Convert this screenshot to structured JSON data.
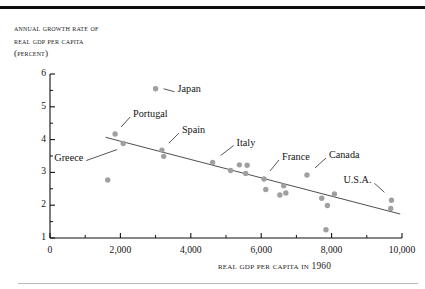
{
  "figure": {
    "y_axis_title_lines": [
      "Annual growth rate of",
      "real GDP per capita",
      "(percent)"
    ],
    "x_axis_title": "Real GDP per capita in 1960"
  },
  "chart_data": {
    "type": "scatter",
    "title": "",
    "xlabel": "Real GDP per capita in 1960",
    "ylabel": "Annual growth rate of real GDP per capita (percent)",
    "xlim": [
      0,
      10000
    ],
    "ylim": [
      1,
      6
    ],
    "grid": false,
    "legend": false,
    "xticks": [
      0,
      2000,
      4000,
      6000,
      8000,
      10000
    ],
    "xtick_labels": [
      "0",
      "2,000",
      "4,000",
      "6,000",
      "8,000",
      "10,000"
    ],
    "xminor_ticks": [
      1000,
      3000,
      5000,
      7000,
      9000
    ],
    "yticks": [
      1,
      2,
      3,
      4,
      5,
      6
    ],
    "ytick_labels": [
      "1",
      "2",
      "3",
      "4",
      "5",
      "6"
    ],
    "yminor_ticks": [
      1.5,
      2.5,
      3.5,
      4.5,
      5.5
    ],
    "point_color": "#a0a0a0",
    "line_color": "#3a3a3a",
    "points": [
      {
        "x": 3000,
        "y": 5.55,
        "label": "Japan"
      },
      {
        "x": 1850,
        "y": 4.17,
        "label": "Portugal"
      },
      {
        "x": 2080,
        "y": 3.88,
        "label": "Greece"
      },
      {
        "x": 3180,
        "y": 3.68,
        "label": "Spain"
      },
      {
        "x": 3230,
        "y": 3.49,
        "label": ""
      },
      {
        "x": 1640,
        "y": 2.77,
        "label": ""
      },
      {
        "x": 4620,
        "y": 3.3,
        "label": "Italy"
      },
      {
        "x": 5130,
        "y": 3.06,
        "label": ""
      },
      {
        "x": 5380,
        "y": 3.23,
        "label": ""
      },
      {
        "x": 5600,
        "y": 3.22,
        "label": ""
      },
      {
        "x": 5560,
        "y": 2.97,
        "label": ""
      },
      {
        "x": 6080,
        "y": 2.8,
        "label": "France"
      },
      {
        "x": 6130,
        "y": 2.48,
        "label": ""
      },
      {
        "x": 6530,
        "y": 2.31,
        "label": ""
      },
      {
        "x": 6640,
        "y": 2.59,
        "label": ""
      },
      {
        "x": 6700,
        "y": 2.37,
        "label": ""
      },
      {
        "x": 7300,
        "y": 2.92,
        "label": "Canada"
      },
      {
        "x": 7720,
        "y": 2.21,
        "label": ""
      },
      {
        "x": 7880,
        "y": 1.99,
        "label": ""
      },
      {
        "x": 7840,
        "y": 1.25,
        "label": ""
      },
      {
        "x": 8080,
        "y": 2.34,
        "label": ""
      },
      {
        "x": 9700,
        "y": 2.15,
        "label": "U.S.A."
      },
      {
        "x": 9680,
        "y": 1.9,
        "label": ""
      }
    ],
    "trendline": {
      "x0": 1580,
      "y0": 4.07,
      "x1": 9950,
      "y1": 1.73
    },
    "annotations": [
      {
        "text": "Japan",
        "x": 3000,
        "y": 5.55
      },
      {
        "text": "Portugal",
        "x": 1850,
        "y": 4.17
      },
      {
        "text": "Greece",
        "x": 2080,
        "y": 3.88
      },
      {
        "text": "Spain",
        "x": 3180,
        "y": 3.68
      },
      {
        "text": "Italy",
        "x": 4620,
        "y": 3.3
      },
      {
        "text": "France",
        "x": 6080,
        "y": 2.8
      },
      {
        "text": "Canada",
        "x": 7300,
        "y": 2.92
      },
      {
        "text": "U.S.A.",
        "x": 9700,
        "y": 2.15
      }
    ]
  }
}
